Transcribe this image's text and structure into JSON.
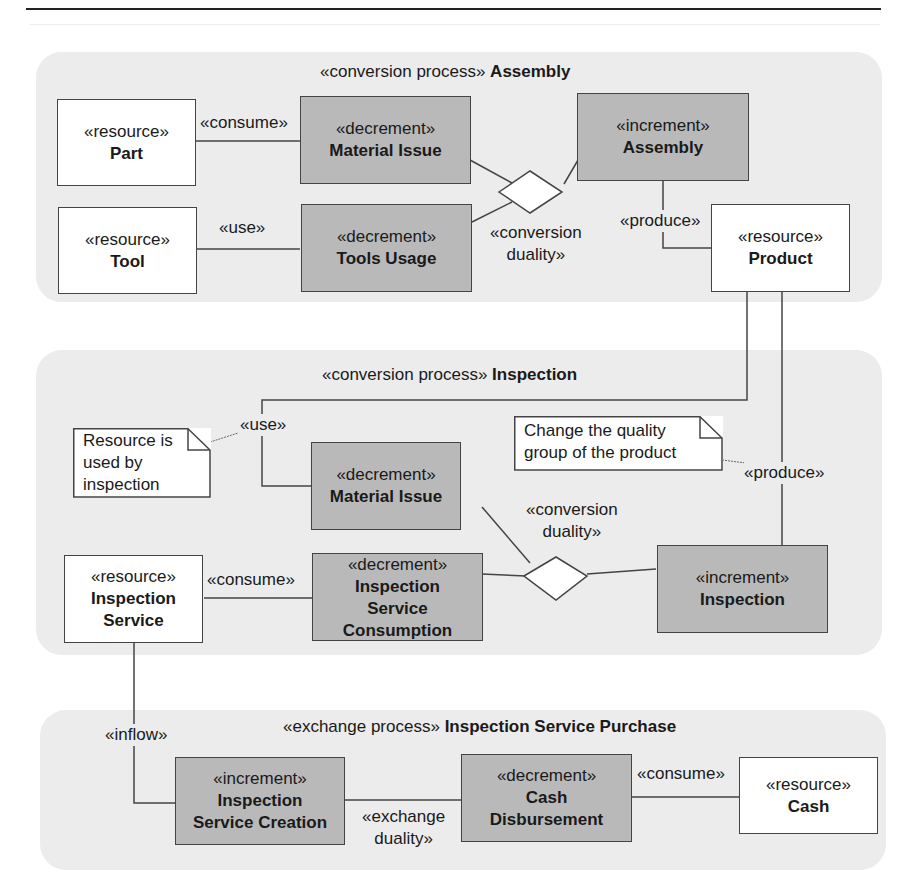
{
  "regions": [
    {
      "stereotype": "«conversion process»",
      "name": "Assembly"
    },
    {
      "stereotype": "«conversion process»",
      "name": "Inspection"
    },
    {
      "stereotype": "«exchange process»",
      "name": "Inspection Service Purchase"
    }
  ],
  "assembly": {
    "part": {
      "stereotype": "«resource»",
      "name": "Part"
    },
    "tool": {
      "stereotype": "«resource»",
      "name": "Tool"
    },
    "material_issue": {
      "stereotype": "«decrement»",
      "name": "Material Issue"
    },
    "tools_usage": {
      "stereotype": "«decrement»",
      "name": "Tools Usage"
    },
    "assembly_inc": {
      "stereotype": "«increment»",
      "name": "Assembly"
    },
    "product": {
      "stereotype": "«resource»",
      "name": "Product"
    },
    "consume_label": "«consume»",
    "use_label": "«use»",
    "produce_label": "«produce»",
    "duality_label_1": "«conversion",
    "duality_label_2": "duality»"
  },
  "inspection": {
    "material_issue": {
      "stereotype": "«decrement»",
      "name": "Material Issue"
    },
    "service_consumption": {
      "stereotype": "«decrement»",
      "name_1": "Inspection",
      "name_2": "Service",
      "name_3": "Consumption"
    },
    "inspection_inc": {
      "stereotype": "«increment»",
      "name": "Inspection"
    },
    "inspection_service": {
      "stereotype": "«resource»",
      "name_1": "Inspection",
      "name_2": "Service"
    },
    "use_label": "«use»",
    "produce_label": "«produce»",
    "consume_label": "«consume»",
    "duality_label_1": "«conversion",
    "duality_label_2": "duality»",
    "note_use": [
      "Resource is",
      "used by",
      "inspection"
    ],
    "note_produce": [
      "Change the quality",
      "group of the product"
    ]
  },
  "purchase": {
    "inflow_label": "«inflow»",
    "service_creation": {
      "stereotype": "«increment»",
      "name_1": "Inspection",
      "name_2": "Service Creation"
    },
    "cash_disbursement": {
      "stereotype": "«decrement»",
      "name_1": "Cash",
      "name_2": "Disbursement"
    },
    "cash": {
      "stereotype": "«resource»",
      "name": "Cash"
    },
    "duality_label_1": "«exchange",
    "duality_label_2": "duality»",
    "consume_label": "«consume»"
  }
}
